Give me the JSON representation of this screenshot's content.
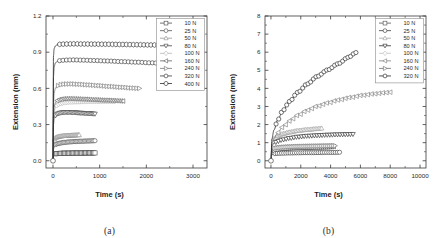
{
  "figure": {
    "panels": [
      {
        "id": "panel-a",
        "caption": "(a)",
        "axes": {
          "xlabel": "Time (s)",
          "ylabel": "Extension (mm)",
          "xlim": [
            -150,
            3300
          ],
          "ylim": [
            -0.06,
            1.2
          ],
          "xticks": [
            0,
            1000,
            2000,
            3000
          ],
          "xtick_labels": [
            "0",
            "1000",
            "2000",
            "3000"
          ],
          "xminor": [
            500,
            1500,
            2500
          ],
          "yticks": [
            0.0,
            0.3,
            0.6,
            0.9,
            1.2
          ],
          "ytick_labels": [
            "0.0",
            "0.3",
            "0.6",
            "0.9",
            "1.2"
          ],
          "yminor": [
            0.15,
            0.45,
            0.75,
            1.05
          ],
          "grid": false
        },
        "legend": {
          "position": "top-right",
          "entries": [
            "10 N",
            "25 N",
            "50 N",
            "80 N",
            "100 N",
            "160 N",
            "240 N",
            "320 N",
            "400 N"
          ]
        }
      },
      {
        "id": "panel-b",
        "caption": "(b)",
        "axes": {
          "xlabel": "Time (s)",
          "ylabel": "Extension (mm)",
          "xlim": [
            -400,
            10400
          ],
          "ylim": [
            -0.4,
            8.0
          ],
          "xticks": [
            0,
            2000,
            4000,
            6000,
            8000,
            10000
          ],
          "xtick_labels": [
            "0",
            "2000",
            "4000",
            "6000",
            "8000",
            "10000"
          ],
          "xminor": [
            1000,
            3000,
            5000,
            7000,
            9000
          ],
          "yticks": [
            0,
            1,
            2,
            3,
            4,
            5,
            6,
            7,
            8
          ],
          "ytick_labels": [
            "0",
            "1",
            "2",
            "3",
            "4",
            "5",
            "6",
            "7",
            "8"
          ],
          "yminor": [
            0.5,
            1.5,
            2.5,
            3.5,
            4.5,
            5.5,
            6.5,
            7.5
          ],
          "grid": false
        },
        "legend": {
          "position": "top-right",
          "entries": [
            "10 N",
            "25 N",
            "50 N",
            "80 N",
            "100 N",
            "160 N",
            "240 N",
            "320 N"
          ]
        }
      }
    ]
  },
  "chart_data": [
    {
      "type": "line",
      "title": "",
      "panel": "(a)",
      "xlabel": "Time (s)",
      "ylabel": "Extension (mm)",
      "xlim": [
        -150,
        3300
      ],
      "ylim": [
        -0.06,
        1.2
      ],
      "xticks": [
        0,
        1000,
        2000,
        3000
      ],
      "yticks": [
        0.0,
        0.3,
        0.6,
        0.9,
        1.2
      ],
      "grid": false,
      "legend": "top-right",
      "series": [
        {
          "name": "10 N",
          "marker": "square",
          "color": "#444444",
          "x": [
            0,
            10,
            30,
            60,
            100,
            160,
            240,
            340,
            460,
            600,
            760,
            900
          ],
          "y": [
            0.0,
            0.035,
            0.052,
            0.058,
            0.06,
            0.062,
            0.063,
            0.063,
            0.064,
            0.064,
            0.065,
            0.065
          ]
        },
        {
          "name": "25 N",
          "marker": "circle",
          "color": "#4a4a4a",
          "x": [
            0,
            10,
            30,
            60,
            100,
            160,
            240,
            340,
            460,
            600,
            760,
            900
          ],
          "y": [
            0.0,
            0.095,
            0.125,
            0.136,
            0.142,
            0.147,
            0.152,
            0.156,
            0.159,
            0.162,
            0.164,
            0.166
          ]
        },
        {
          "name": "50 N",
          "marker": "triangle",
          "color": "#8f8f8f",
          "x": [
            0,
            10,
            30,
            60,
            100,
            160,
            240,
            340,
            460,
            560
          ],
          "y": [
            0.0,
            0.15,
            0.18,
            0.192,
            0.198,
            0.203,
            0.207,
            0.21,
            0.212,
            0.214
          ]
        },
        {
          "name": "80 N",
          "marker": "triangle-down",
          "color": "#3a3a3a",
          "x": [
            0,
            10,
            25,
            50,
            90,
            150,
            230,
            330,
            450,
            600,
            760,
            900
          ],
          "y": [
            0.0,
            0.3,
            0.352,
            0.375,
            0.389,
            0.397,
            0.401,
            0.402,
            0.4,
            0.396,
            0.392,
            0.389
          ]
        },
        {
          "name": "100 N",
          "marker": "diamond",
          "color": "#b0b0b0",
          "x": [
            0,
            10,
            25,
            50,
            90,
            150,
            240,
            360,
            500,
            680,
            880,
            1100,
            1320
          ],
          "y": [
            0.0,
            0.33,
            0.405,
            0.44,
            0.462,
            0.474,
            0.482,
            0.487,
            0.489,
            0.491,
            0.492,
            0.493,
            0.494
          ]
        },
        {
          "name": "160 N",
          "marker": "left-triangle",
          "color": "#5a5a5a",
          "x": [
            0,
            10,
            25,
            50,
            90,
            150,
            240,
            360,
            500,
            680,
            880,
            1100,
            1320,
            1500
          ],
          "y": [
            0.0,
            0.37,
            0.445,
            0.48,
            0.499,
            0.509,
            0.514,
            0.515,
            0.513,
            0.51,
            0.506,
            0.502,
            0.498,
            0.495
          ]
        },
        {
          "name": "240 N",
          "marker": "right-triangle",
          "color": "#6e6e6e",
          "x": [
            0,
            10,
            25,
            50,
            90,
            160,
            260,
            400,
            560,
            760,
            980,
            1220,
            1480,
            1700,
            1850
          ],
          "y": [
            0.0,
            0.47,
            0.56,
            0.6,
            0.62,
            0.631,
            0.636,
            0.637,
            0.634,
            0.629,
            0.623,
            0.616,
            0.609,
            0.603,
            0.6
          ]
        },
        {
          "name": "320 N",
          "marker": "circle",
          "color": "#2d2d2d",
          "x": [
            0,
            10,
            25,
            50,
            90,
            160,
            280,
            440,
            640,
            880,
            1160,
            1480,
            1800,
            2100,
            2350
          ],
          "y": [
            0.0,
            0.7,
            0.78,
            0.81,
            0.824,
            0.831,
            0.835,
            0.836,
            0.834,
            0.831,
            0.827,
            0.822,
            0.817,
            0.812,
            0.808
          ]
        },
        {
          "name": "400 N",
          "marker": "hexagon",
          "color": "#1f1f1f",
          "x": [
            0,
            10,
            25,
            50,
            90,
            160,
            280,
            440,
            640,
            880,
            1160,
            1480,
            1800,
            2100,
            2400
          ],
          "y": [
            0.0,
            0.87,
            0.93,
            0.952,
            0.961,
            0.966,
            0.968,
            0.969,
            0.968,
            0.967,
            0.966,
            0.964,
            0.962,
            0.96,
            0.958
          ]
        }
      ]
    },
    {
      "type": "line",
      "title": "",
      "panel": "(b)",
      "xlabel": "Time (s)",
      "ylabel": "Extension (mm)",
      "xlim": [
        -400,
        10400
      ],
      "ylim": [
        -0.4,
        8.0
      ],
      "xticks": [
        0,
        2000,
        4000,
        6000,
        8000,
        10000
      ],
      "yticks": [
        0,
        1,
        2,
        3,
        4,
        5,
        6,
        7,
        8
      ],
      "grid": false,
      "legend": "top-right",
      "series": [
        {
          "name": "10 N",
          "marker": "square",
          "color": "#4a4a4a",
          "x": [
            0,
            60,
            200,
            450,
            800,
            1250,
            1800,
            2450,
            3100,
            3700,
            4200
          ],
          "y": [
            0.0,
            0.46,
            0.58,
            0.64,
            0.68,
            0.71,
            0.73,
            0.75,
            0.76,
            0.77,
            0.78
          ]
        },
        {
          "name": "25 N",
          "marker": "circle",
          "color": "#333333",
          "x": [
            0,
            60,
            200,
            450,
            800,
            1250,
            1800,
            2450,
            3100,
            3700,
            4300,
            4600
          ],
          "y": [
            0.0,
            0.34,
            0.39,
            0.41,
            0.42,
            0.43,
            0.44,
            0.45,
            0.45,
            0.46,
            0.46,
            0.47
          ]
        },
        {
          "name": "50 N",
          "marker": "triangle",
          "color": "#9a9a9a",
          "x": [
            0,
            60,
            200,
            450,
            800,
            1250,
            1800,
            2450,
            3000,
            3400
          ],
          "y": [
            0.0,
            1.0,
            1.22,
            1.37,
            1.49,
            1.58,
            1.66,
            1.72,
            1.76,
            1.79
          ]
        },
        {
          "name": "80 N",
          "marker": "triangle-down",
          "color": "#222222",
          "x": [
            0,
            60,
            200,
            450,
            800,
            1250,
            1800,
            2450,
            3100,
            3800,
            4500,
            5100,
            5500
          ],
          "y": [
            0.0,
            0.82,
            0.97,
            1.08,
            1.17,
            1.25,
            1.32,
            1.37,
            1.4,
            1.43,
            1.45,
            1.46,
            1.47
          ]
        },
        {
          "name": "100 N",
          "marker": "diamond",
          "color": "#bcbcbc",
          "x": [
            0,
            60,
            200,
            450,
            800,
            1250,
            1800,
            2450,
            3100,
            3700,
            4100
          ],
          "y": [
            0.0,
            0.58,
            0.66,
            0.71,
            0.74,
            0.77,
            0.79,
            0.81,
            0.82,
            0.83,
            0.84
          ]
        },
        {
          "name": "160 N",
          "marker": "left-triangle",
          "color": "#787878",
          "x": [
            0,
            60,
            200,
            450,
            800,
            1250,
            1800,
            2450,
            3100,
            3800,
            4500,
            5300,
            6100,
            6900,
            7600,
            8000
          ],
          "y": [
            0.0,
            0.9,
            1.22,
            1.55,
            1.88,
            2.2,
            2.52,
            2.8,
            3.02,
            3.2,
            3.36,
            3.5,
            3.62,
            3.7,
            3.76,
            3.79
          ]
        },
        {
          "name": "240 N",
          "marker": "right-triangle",
          "color": "#666666",
          "x": [
            0,
            60,
            200,
            450,
            800,
            1250,
            1800,
            2450,
            3100,
            3800,
            4300
          ],
          "y": [
            0.0,
            0.6,
            0.68,
            0.72,
            0.75,
            0.77,
            0.79,
            0.8,
            0.81,
            0.82,
            0.83
          ]
        },
        {
          "name": "320 N",
          "marker": "circle",
          "color": "#1a1a1a",
          "x": [
            0,
            60,
            200,
            450,
            800,
            1250,
            1800,
            2450,
            3100,
            3800,
            4500,
            5200,
            5700
          ],
          "y": [
            0.0,
            1.2,
            1.7,
            2.25,
            2.78,
            3.28,
            3.78,
            4.25,
            4.66,
            5.02,
            5.36,
            5.72,
            5.98
          ]
        }
      ]
    }
  ]
}
